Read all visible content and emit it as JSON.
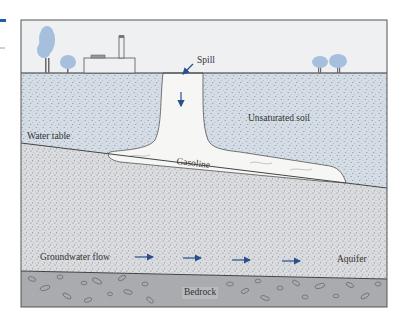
{
  "diagram": {
    "labels": {
      "spill": "Spill",
      "unsaturated_soil": "Unsaturated soil",
      "water_table": "Water table",
      "gasoline": "Gasoline",
      "groundwater_flow": "Groundwater flow",
      "aquifer": "Aquifer",
      "bedrock": "Bedrock"
    },
    "layers": [
      {
        "name": "Sky / surface",
        "color": "#eef0f2"
      },
      {
        "name": "Unsaturated soil",
        "color": "#d4dde5"
      },
      {
        "name": "Gasoline plume",
        "color": "#f6f6f4"
      },
      {
        "name": "Aquifer (saturated zone)",
        "color": "#dadcdf"
      },
      {
        "name": "Bedrock",
        "color": "#a9abae"
      }
    ],
    "surface_features": [
      "tree",
      "tree",
      "factory-with-smokestack",
      "tree",
      "tree"
    ],
    "flow_arrows_count": 4,
    "colors": {
      "arrow": "#2a4f8f",
      "tree": "#a6bfdc",
      "outline": "#444444",
      "accent_mark": "#1f5fa8"
    }
  }
}
